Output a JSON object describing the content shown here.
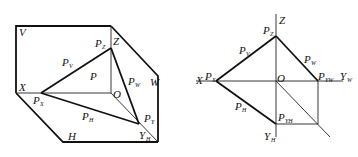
{
  "left_figure": {
    "description": "Axonometric view of plane P intersecting projection planes V, H, W",
    "labels": {
      "V": "V",
      "W": "W",
      "H": "H",
      "X": "X",
      "Z": "Z",
      "O": "O",
      "P": "P",
      "PV": {
        "main": "P",
        "sub": "V"
      },
      "PW": {
        "main": "P",
        "sub": "W"
      },
      "PH": {
        "main": "P",
        "sub": "H"
      },
      "PX": {
        "main": "P",
        "sub": "X"
      },
      "PZ": {
        "main": "P",
        "sub": "Z"
      },
      "PY": {
        "main": "P",
        "sub": "Y"
      },
      "YH": {
        "main": "Y",
        "sub": "H"
      }
    }
  },
  "right_figure": {
    "description": "Orthographic projection of plane P traces",
    "labels": {
      "Z": "Z",
      "O": "O",
      "X": "X",
      "PZ": {
        "main": "P",
        "sub": "Z"
      },
      "PV": {
        "main": "P",
        "sub": "V"
      },
      "PW": {
        "main": "P",
        "sub": "W"
      },
      "PX": {
        "main": "P",
        "sub": "X"
      },
      "PH": {
        "main": "P",
        "sub": "H"
      },
      "PYW": {
        "main": "P",
        "sub": "YW"
      },
      "PYH": {
        "main": "P",
        "sub": "YH"
      },
      "YW": {
        "main": "Y",
        "sub": "W"
      },
      "YH": {
        "main": "Y",
        "sub": "H"
      }
    }
  }
}
